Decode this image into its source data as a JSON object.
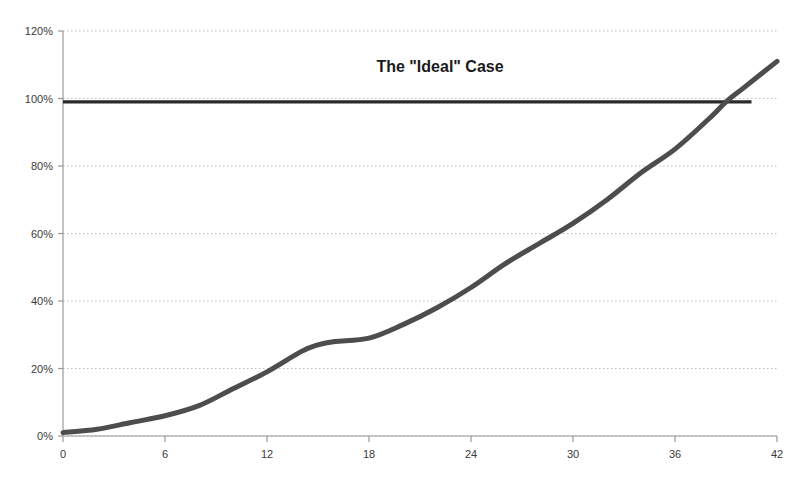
{
  "chart_data": {
    "type": "line",
    "title": "The \"Ideal\" Case",
    "xlabel": "",
    "ylabel": "",
    "xlim": [
      0,
      42
    ],
    "ylim": [
      0,
      120
    ],
    "grid": true,
    "legend_position": "none",
    "x_tick_labels": [
      "0",
      "6",
      "12",
      "18",
      "24",
      "30",
      "36",
      "42"
    ],
    "x_ticks": [
      0,
      6,
      12,
      18,
      24,
      30,
      36,
      42
    ],
    "y_tick_labels": [
      "0%",
      "20%",
      "40%",
      "60%",
      "80%",
      "100%",
      "120%"
    ],
    "y_ticks": [
      0,
      20,
      40,
      60,
      80,
      100,
      120
    ],
    "series": [
      {
        "name": "Cumulative Progress",
        "color": "#4d4d4d",
        "x": [
          0,
          2,
          4,
          6,
          8,
          10,
          12,
          14,
          15,
          16,
          18,
          20,
          22,
          24,
          26,
          28,
          30,
          32,
          34,
          36,
          38,
          39,
          40,
          42
        ],
        "values": [
          1,
          2,
          4,
          6,
          9,
          14,
          19,
          25,
          27,
          28,
          29,
          33,
          38,
          44,
          51,
          57,
          63,
          70,
          78,
          85,
          94,
          99,
          103,
          111
        ]
      },
      {
        "name": "Target (100%)",
        "color": "#2b2b2b",
        "x": [
          0,
          40.5
        ],
        "values": [
          99,
          99
        ]
      }
    ],
    "annotations": []
  },
  "colors": {
    "series_line": "#4d4d4d",
    "target_line": "#2b2b2b",
    "grid": "#bfbfbf",
    "axis": "#9a9a9a",
    "text": "#3a3a3a",
    "title_text": "#1a1a1a",
    "background": "#ffffff"
  }
}
